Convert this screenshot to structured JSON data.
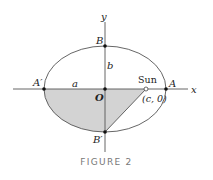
{
  "figure": {
    "caption": "FIGURE 2",
    "colors": {
      "line": "#555555",
      "fill": "#d3d3d3",
      "point": "#111111",
      "caption": "#777777"
    },
    "labels": {
      "y_axis": "y",
      "x_axis": "x",
      "B": "B",
      "B_prime": "B′",
      "A": "A",
      "A_prime": "A′",
      "O": "O",
      "a": "a",
      "b": "b",
      "sun": "Sun",
      "focus": "(c, 0)"
    }
  }
}
